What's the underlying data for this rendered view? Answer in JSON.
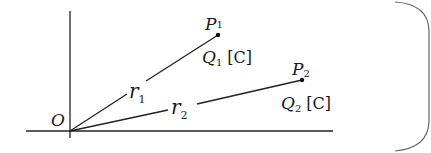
{
  "diagram": {
    "type": "coordinate-plane vector diagram",
    "origin": {
      "label": "O",
      "x": 70,
      "y": 131
    },
    "axes": {
      "vertical": {
        "x": 70,
        "y_top": 11,
        "y_bottom": 138
      },
      "horizontal": {
        "y": 131,
        "x_left": 26,
        "x_right": 333
      }
    },
    "points": [
      {
        "id": "P1",
        "label": "P",
        "sub": "1",
        "x": 218,
        "y": 35,
        "charge": {
          "label": "Q",
          "sub": "1",
          "unit": "[C]"
        }
      },
      {
        "id": "P2",
        "label": "P",
        "sub": "2",
        "x": 302,
        "y": 80,
        "charge": {
          "label": "Q",
          "sub": "2",
          "unit": "[C]"
        }
      }
    ],
    "vectors": [
      {
        "id": "r1",
        "label": "r",
        "sub": "1",
        "from": "O",
        "to": "P1"
      },
      {
        "id": "r2",
        "label": "r",
        "sub": "2",
        "from": "O",
        "to": "P2"
      }
    ],
    "colors": {
      "ink": "#222222",
      "frame": "#666666",
      "background": "#ffffff"
    }
  }
}
